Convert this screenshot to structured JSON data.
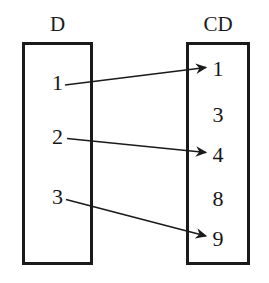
{
  "diagram": {
    "title_left": "D",
    "title_right": "CD",
    "stroke_color": "#1a1a1a",
    "background_color": "#ffffff",
    "left_set": {
      "label": "D",
      "elements": [
        "1",
        "2",
        "3"
      ]
    },
    "right_set": {
      "label": "CD",
      "elements": [
        "1",
        "3",
        "4",
        "8",
        "9"
      ]
    },
    "mappings": [
      {
        "from": "1",
        "to": "1"
      },
      {
        "from": "2",
        "to": "4"
      },
      {
        "from": "3",
        "to": "9"
      }
    ]
  }
}
